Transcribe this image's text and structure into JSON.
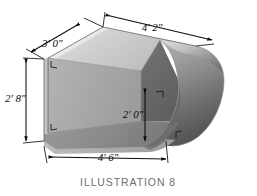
{
  "figure": {
    "caption": "ILLUSTRATION 8",
    "object_description": "hollow open-front box with rounded bullnose right end",
    "background_color": "#ffffff"
  },
  "dimensions": {
    "depth_top_left": {
      "label": "3' 0\"",
      "feet": 3,
      "inches": 0,
      "position": "upper-left",
      "measures": "depth of box"
    },
    "length_top": {
      "label": "4' 2\"",
      "feet": 4,
      "inches": 2,
      "position": "top",
      "measures": "top length of box"
    },
    "height_left": {
      "label": "2' 8\"",
      "feet": 2,
      "inches": 8,
      "position": "left",
      "measures": "overall height of box"
    },
    "height_inner": {
      "label": "2' 0\"",
      "feet": 2,
      "inches": 0,
      "position": "center",
      "measures": "inner cavity height"
    },
    "length_bottom": {
      "label": "4' 6\"",
      "feet": 4,
      "inches": 6,
      "position": "bottom",
      "measures": "bottom length of box"
    }
  },
  "palette": {
    "top_face": "#c9c9c9",
    "top_face_light": "#dedede",
    "front_face": "#8e8e8e",
    "front_face_dark": "#6e6e6e",
    "inner_left_wall": "#a8a8a8",
    "inner_back_wall": "#6a6a6a",
    "inner_floor": "#949494",
    "rounded_end_light": "#d2d2d2",
    "rounded_end_dark": "#5d5d5d",
    "base_strip": "#adadad",
    "line_color": "#0d0d0d",
    "caption_color": "#6f6f6f"
  }
}
